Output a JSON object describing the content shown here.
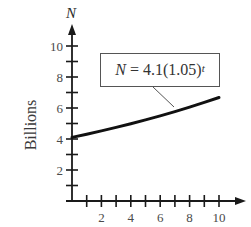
{
  "chart_data": {
    "type": "line",
    "title": "",
    "equation": {
      "lhs": "N",
      "equals": " = ",
      "base": "4.1(1.05)",
      "exponent": "t"
    },
    "xlabel": "",
    "ylabel": "Billions",
    "y_var": "N",
    "xlim": [
      0,
      10
    ],
    "ylim": [
      0,
      10
    ],
    "x_ticks": [
      1,
      2,
      3,
      4,
      5,
      6,
      7,
      8,
      9,
      10
    ],
    "x_tick_labels": [
      "2",
      "4",
      "6",
      "8",
      "10"
    ],
    "y_ticks": [
      1,
      2,
      3,
      4,
      5,
      6,
      7,
      8,
      9,
      10
    ],
    "y_tick_labels": [
      "2",
      "4",
      "6",
      "8",
      "10"
    ],
    "grid": false,
    "legend": "none",
    "series": [
      {
        "name": "N = 4.1(1.05)^t",
        "x": [
          0,
          1,
          2,
          3,
          4,
          5,
          6,
          7,
          8,
          9,
          10
        ],
        "values": [
          4.1,
          4.31,
          4.52,
          4.75,
          4.98,
          5.23,
          5.49,
          5.77,
          6.06,
          6.36,
          6.68
        ]
      }
    ]
  }
}
